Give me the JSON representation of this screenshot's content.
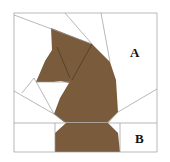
{
  "diagram": {
    "type": "paper-piecing quilt block",
    "colors": {
      "background": "#ffffff",
      "fabric": "#7a5c3c",
      "line": "#9a9a9a",
      "seam": "#4a3520"
    },
    "labels": [
      {
        "id": "A",
        "text": "A",
        "x": 134,
        "y": 57
      },
      {
        "id": "B",
        "text": "B",
        "x": 139,
        "y": 143
      }
    ]
  }
}
